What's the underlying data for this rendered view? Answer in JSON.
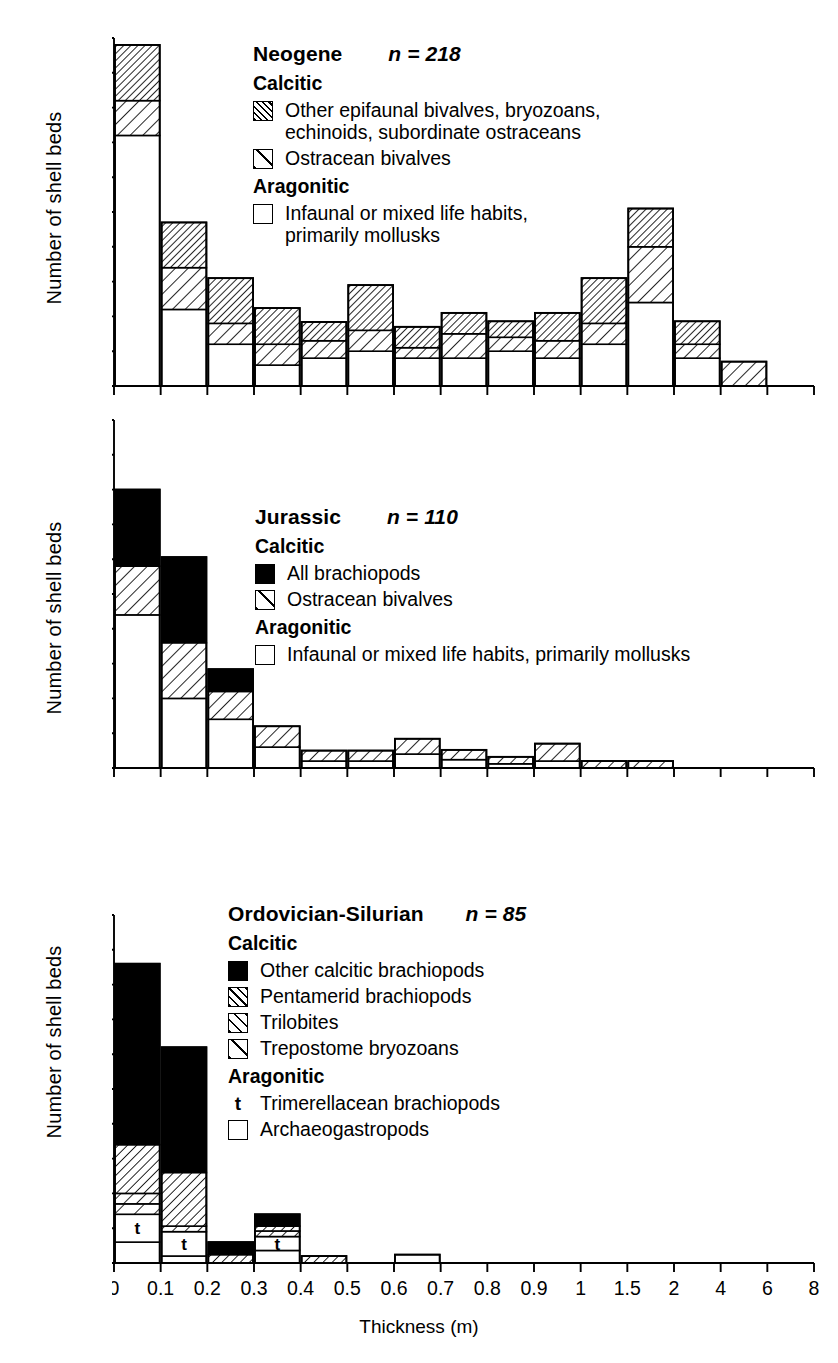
{
  "figure": {
    "xlabel": "Thickness (m)",
    "ylabel": "Number of shell beds",
    "x_tick_labels": [
      "0",
      "0.1",
      "0.2",
      "0.3",
      "0.4",
      "0.5",
      "0.6",
      "0.7",
      "0.8",
      "0.9",
      "1",
      "1.5",
      "2",
      "4",
      "6",
      "8"
    ],
    "y_tick_labels": [
      "0",
      "10",
      "20",
      "30",
      "40",
      "50"
    ],
    "ylim": [
      0,
      50
    ],
    "n_equals": "n ="
  },
  "chart_data": [
    {
      "type": "bar",
      "title": "Neogene",
      "subtitle": "n = 218",
      "n": 218,
      "panel_id": "neogene",
      "xlabel": "Thickness (m)",
      "ylabel": "Number of shell beds",
      "ylim": [
        0,
        50
      ],
      "grid": false,
      "stacked": true,
      "categories": [
        "0-0.1",
        "0.1-0.2",
        "0.2-0.3",
        "0.3-0.4",
        "0.4-0.5",
        "0.5-0.6",
        "0.6-0.7",
        "0.7-0.8",
        "0.8-0.9",
        "0.9-1",
        "1-1.5",
        "1.5-2",
        "2-4",
        "4-6",
        "6-8"
      ],
      "series": [
        {
          "name": "Infaunal or mixed life habits, primarily mollusks",
          "fill": "white",
          "values": [
            36,
            11,
            6,
            3,
            4,
            5,
            4,
            4,
            5,
            4,
            6,
            12,
            4,
            0,
            0
          ]
        },
        {
          "name": "Ostracean bivalves",
          "fill": "hatch-wide",
          "values": [
            5,
            6,
            3,
            3,
            2.5,
            3,
            1.5,
            3.5,
            2,
            2.5,
            3,
            8,
            2,
            3.5,
            0
          ]
        },
        {
          "name": "Other epifaunal bivalves, bryozoans, echinoids, subordinate ostraceans",
          "fill": "hatch-narrow",
          "values": [
            8,
            6.5,
            6.5,
            5.2,
            2.7,
            6.5,
            3,
            3,
            2.3,
            4,
            6.5,
            5.5,
            3.3,
            0,
            0
          ]
        }
      ],
      "totals": [
        49,
        23.5,
        15.5,
        11.2,
        9.2,
        14.5,
        8.5,
        10.5,
        9.3,
        10.5,
        15.5,
        25.5,
        9.3,
        3.5,
        0
      ],
      "legend": {
        "groups": [
          {
            "heading": "Calcitic",
            "entries": [
              {
                "swatch": "hatch-narrow",
                "label": "Other epifaunal bivalves, bryozoans,\nechinoids, subordinate ostraceans"
              },
              {
                "swatch": "hatch-single",
                "label": "Ostracean bivalves"
              }
            ]
          },
          {
            "heading": "Aragonitic",
            "entries": [
              {
                "swatch": "white",
                "label": "Infaunal or mixed life habits,\nprimarily mollusks"
              }
            ]
          }
        ]
      }
    },
    {
      "type": "bar",
      "title": "Jurassic",
      "subtitle": "n = 110",
      "n": 110,
      "panel_id": "jurassic",
      "xlabel": "Thickness (m)",
      "ylabel": "Number of shell beds",
      "ylim": [
        0,
        50
      ],
      "grid": false,
      "stacked": true,
      "categories": [
        "0-0.1",
        "0.1-0.2",
        "0.2-0.3",
        "0.3-0.4",
        "0.4-0.5",
        "0.5-0.6",
        "0.6-0.7",
        "0.7-0.8",
        "0.8-0.9",
        "0.9-1",
        "1-1.5",
        "1.5-2",
        "2-4",
        "4-6",
        "6-8"
      ],
      "series": [
        {
          "name": "Infaunal or mixed life habits, primarily mollusks",
          "fill": "white",
          "values": [
            22,
            10,
            7,
            3,
            1,
            1,
            2,
            1.2,
            0.6,
            1,
            0,
            0,
            0,
            0,
            0
          ]
        },
        {
          "name": "Ostracean bivalves",
          "fill": "hatch-wide",
          "values": [
            7,
            8,
            4,
            3,
            1.5,
            1.5,
            2.2,
            1.4,
            1,
            2.5,
            1,
            1,
            0,
            0,
            0
          ]
        },
        {
          "name": "All brachiopods",
          "fill": "solid",
          "values": [
            11,
            12.3,
            3.2,
            0,
            0,
            0,
            0,
            0,
            0,
            0,
            0,
            0,
            0,
            0,
            0
          ]
        }
      ],
      "totals": [
        40,
        30.3,
        14.2,
        6,
        2.5,
        2.5,
        4.2,
        2.6,
        1.6,
        3.5,
        1,
        1,
        0,
        0,
        0
      ],
      "legend": {
        "groups": [
          {
            "heading": "Calcitic",
            "entries": [
              {
                "swatch": "solid",
                "label": "All brachiopods"
              },
              {
                "swatch": "hatch-single",
                "label": "Ostracean bivalves"
              }
            ]
          },
          {
            "heading": "Aragonitic",
            "entries": [
              {
                "swatch": "white",
                "label": "Infaunal or mixed life habits, primarily mollusks"
              }
            ]
          }
        ]
      }
    },
    {
      "type": "bar",
      "title": "Ordovician-Silurian",
      "subtitle": "n = 85",
      "n": 85,
      "panel_id": "ordovician-silurian",
      "xlabel": "Thickness (m)",
      "ylabel": "Number of shell beds",
      "ylim": [
        0,
        50
      ],
      "grid": false,
      "stacked": true,
      "categories": [
        "0-0.1",
        "0.1-0.2",
        "0.2-0.3",
        "0.3-0.4",
        "0.4-0.5",
        "0.5-0.6",
        "0.6-0.7",
        "0.7-0.8",
        "0.8-0.9",
        "0.9-1",
        "1-1.5",
        "1.5-2",
        "2-4",
        "4-6",
        "6-8"
      ],
      "series": [
        {
          "name": "Archaeogastropods",
          "fill": "white",
          "values": [
            3,
            1,
            0,
            1.8,
            0,
            0,
            1.2,
            0,
            0,
            0,
            0,
            0,
            0,
            0,
            0
          ]
        },
        {
          "name": "Trimerellacean brachiopods",
          "fill": "t-marked",
          "values": [
            4,
            3.5,
            0,
            2.0,
            0,
            0,
            0,
            0,
            0,
            0,
            0,
            0,
            0,
            0,
            0
          ]
        },
        {
          "name": "Trepostome bryozoans",
          "fill": "hatch-single",
          "values": [
            1.5,
            0,
            0,
            0,
            0,
            0,
            0,
            0,
            0,
            0,
            0,
            0,
            0,
            0,
            0
          ]
        },
        {
          "name": "Trilobites",
          "fill": "hatch-wide",
          "values": [
            1.5,
            0.8,
            0,
            0.8,
            0,
            0,
            0,
            0,
            0,
            0,
            0,
            0,
            0,
            0,
            0
          ]
        },
        {
          "name": "Pentamerid brachiopods",
          "fill": "hatch-med",
          "values": [
            7,
            7.7,
            1.2,
            0.7,
            1.0,
            0,
            0,
            0,
            0,
            0,
            0,
            0,
            0,
            0,
            0
          ]
        },
        {
          "name": "Other calcitic brachiopods",
          "fill": "solid",
          "values": [
            26,
            18,
            1.8,
            1.7,
            0,
            0,
            0,
            0,
            0,
            0,
            0,
            0,
            0,
            0,
            0
          ]
        }
      ],
      "totals": [
        43,
        31,
        3,
        6,
        1,
        0,
        1.2,
        0,
        0,
        0,
        0,
        0,
        0,
        0,
        0
      ],
      "t_markers": [
        {
          "bin_index": 0,
          "label": "t"
        },
        {
          "bin_index": 1,
          "label": "t"
        },
        {
          "bin_index": 3,
          "label": "t"
        }
      ],
      "legend": {
        "groups": [
          {
            "heading": "Calcitic",
            "entries": [
              {
                "swatch": "solid",
                "label": "Other calcitic brachiopods"
              },
              {
                "swatch": "hatch-med",
                "label": "Pentamerid brachiopods"
              },
              {
                "swatch": "hatch-wide",
                "label": "Trilobites"
              },
              {
                "swatch": "hatch-single",
                "label": "Trepostome bryozoans"
              }
            ]
          },
          {
            "heading": "Aragonitic",
            "entries": [
              {
                "swatch": "t-glyph",
                "label": "Trimerellacean brachiopods"
              },
              {
                "swatch": "white",
                "label": "Archaeogastropods"
              }
            ]
          }
        ]
      }
    }
  ]
}
